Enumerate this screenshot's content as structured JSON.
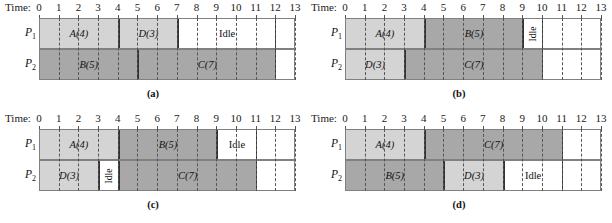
{
  "figure": {
    "time_label": "Time:",
    "ticks": [
      0,
      1,
      2,
      3,
      4,
      5,
      6,
      7,
      8,
      9,
      10,
      11,
      12,
      13
    ],
    "axis_max": 13,
    "row_labels": [
      "P",
      "P"
    ],
    "row_subs": [
      "1",
      "2"
    ],
    "colors": {
      "light_task": "#d4d4d4",
      "dark_task": "#a8a8a8",
      "idle": "#ffffff",
      "border": "#808080",
      "gridline": "#555555"
    }
  },
  "panels": [
    {
      "caption": "(a)",
      "rows": [
        {
          "label": "P",
          "sub": "1",
          "blocks": [
            {
              "text": "A(4)",
              "start": 0,
              "end": 4,
              "shade": "light"
            },
            {
              "text": "D(3)",
              "start": 4,
              "end": 7,
              "shade": "light"
            },
            {
              "text": "Idle",
              "start": 7,
              "end": 12,
              "shade": "idle"
            }
          ]
        },
        {
          "label": "P",
          "sub": "2",
          "blocks": [
            {
              "text": "B(5)",
              "start": 0,
              "end": 5,
              "shade": "dark"
            },
            {
              "text": "C(7)",
              "start": 5,
              "end": 12,
              "shade": "dark"
            }
          ]
        }
      ]
    },
    {
      "caption": "(b)",
      "rows": [
        {
          "label": "P",
          "sub": "1",
          "blocks": [
            {
              "text": "A(4)",
              "start": 0,
              "end": 4,
              "shade": "light"
            },
            {
              "text": "B(5)",
              "start": 4,
              "end": 9,
              "shade": "dark"
            },
            {
              "text": "Idle",
              "start": 9,
              "end": 10,
              "shade": "idle",
              "vertical": true
            }
          ]
        },
        {
          "label": "P",
          "sub": "2",
          "blocks": [
            {
              "text": "D(3)",
              "start": 0,
              "end": 3,
              "shade": "light"
            },
            {
              "text": "C(7)",
              "start": 3,
              "end": 10,
              "shade": "dark"
            }
          ]
        }
      ]
    },
    {
      "caption": "(c)",
      "rows": [
        {
          "label": "P",
          "sub": "1",
          "blocks": [
            {
              "text": "A(4)",
              "start": 0,
              "end": 4,
              "shade": "light"
            },
            {
              "text": "B(5)",
              "start": 4,
              "end": 9,
              "shade": "dark"
            },
            {
              "text": "Idle",
              "start": 9,
              "end": 11,
              "shade": "idle"
            }
          ]
        },
        {
          "label": "P",
          "sub": "2",
          "blocks": [
            {
              "text": "D(3)",
              "start": 0,
              "end": 3,
              "shade": "light"
            },
            {
              "text": "Idle",
              "start": 3,
              "end": 4,
              "shade": "idle",
              "vertical": true
            },
            {
              "text": "C(7)",
              "start": 4,
              "end": 11,
              "shade": "dark"
            }
          ]
        }
      ]
    },
    {
      "caption": "(d)",
      "rows": [
        {
          "label": "P",
          "sub": "1",
          "blocks": [
            {
              "text": "A(4)",
              "start": 0,
              "end": 4,
              "shade": "light"
            },
            {
              "text": "C(7)",
              "start": 4,
              "end": 11,
              "shade": "dark"
            }
          ]
        },
        {
          "label": "P",
          "sub": "2",
          "blocks": [
            {
              "text": "B(5)",
              "start": 0,
              "end": 5,
              "shade": "dark"
            },
            {
              "text": "D(3)",
              "start": 5,
              "end": 8,
              "shade": "light"
            },
            {
              "text": "Idle",
              "start": 8,
              "end": 11,
              "shade": "idle"
            }
          ]
        }
      ]
    }
  ],
  "chart_data": {
    "type": "bar",
    "xlabel": "Time",
    "ylabel": "Processor",
    "x": [
      0,
      1,
      2,
      3,
      4,
      5,
      6,
      7,
      8,
      9,
      10,
      11,
      12,
      13
    ],
    "xlim": [
      0,
      13
    ],
    "grid": true,
    "legend": "none",
    "series": [
      {
        "name": "(a) P1",
        "intervals": [
          [
            "A(4)",
            0,
            4
          ],
          [
            "D(3)",
            4,
            7
          ],
          [
            "Idle",
            7,
            12
          ]
        ]
      },
      {
        "name": "(a) P2",
        "intervals": [
          [
            "B(5)",
            0,
            5
          ],
          [
            "C(7)",
            5,
            12
          ]
        ]
      },
      {
        "name": "(b) P1",
        "intervals": [
          [
            "A(4)",
            0,
            4
          ],
          [
            "B(5)",
            4,
            9
          ],
          [
            "Idle",
            9,
            10
          ]
        ]
      },
      {
        "name": "(b) P2",
        "intervals": [
          [
            "D(3)",
            0,
            3
          ],
          [
            "C(7)",
            3,
            10
          ]
        ]
      },
      {
        "name": "(c) P1",
        "intervals": [
          [
            "A(4)",
            0,
            4
          ],
          [
            "B(5)",
            4,
            9
          ],
          [
            "Idle",
            9,
            11
          ]
        ]
      },
      {
        "name": "(c) P2",
        "intervals": [
          [
            "D(3)",
            0,
            3
          ],
          [
            "Idle",
            3,
            4
          ],
          [
            "C(7)",
            4,
            11
          ]
        ]
      },
      {
        "name": "(d) P1",
        "intervals": [
          [
            "A(4)",
            0,
            4
          ],
          [
            "C(7)",
            4,
            11
          ]
        ]
      },
      {
        "name": "(d) P2",
        "intervals": [
          [
            "B(5)",
            0,
            5
          ],
          [
            "D(3)",
            5,
            8
          ],
          [
            "Idle",
            8,
            11
          ]
        ]
      }
    ]
  }
}
